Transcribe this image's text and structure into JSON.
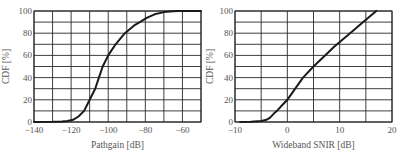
{
  "chart_data": [
    {
      "type": "line",
      "title": "",
      "xlabel": "Pathgain [dB]",
      "ylabel": "CDF [%]",
      "xlim": [
        -140,
        -50
      ],
      "ylim": [
        0,
        100
      ],
      "xticks": [
        -140,
        -120,
        -100,
        -80,
        -60
      ],
      "yticks": [
        0,
        20,
        40,
        60,
        80,
        100
      ],
      "grid": true,
      "grid_x_step": 10,
      "grid_y_step": 10,
      "legend": null,
      "series": [
        {
          "name": "Pathgain CDF",
          "x": [
            -140,
            -130,
            -125,
            -122,
            -119,
            -116,
            -113,
            -110,
            -107,
            -105,
            -103,
            -100,
            -96,
            -91,
            -86,
            -83,
            -79,
            -75,
            -70,
            -65,
            -62,
            -55,
            -50
          ],
          "y": [
            0,
            0.2,
            0.5,
            1,
            2,
            5,
            10,
            20,
            30,
            40,
            50,
            60,
            70,
            80,
            87,
            90,
            94,
            97,
            99,
            99.7,
            100,
            100,
            100
          ]
        }
      ]
    },
    {
      "type": "line",
      "title": "",
      "xlabel": "Wideband SNIR [dB]",
      "ylabel": "CDF [%]",
      "xlim": [
        -10,
        20
      ],
      "ylim": [
        0,
        100
      ],
      "xticks": [
        -10,
        0,
        10,
        20
      ],
      "yticks": [
        0,
        20,
        40,
        60,
        80,
        100
      ],
      "grid": true,
      "grid_x_step": 5,
      "grid_y_step": 10,
      "legend": null,
      "series": [
        {
          "name": "Wideband SNIR CDF",
          "x": [
            -9,
            -7,
            -5,
            -4,
            -3.3,
            -2.5,
            -2,
            -1,
            0,
            1.5,
            3,
            5,
            7,
            9,
            12,
            14.5,
            17
          ],
          "y": [
            0,
            0.3,
            1,
            2,
            4,
            8,
            10,
            15,
            20,
            30,
            40,
            50,
            59,
            68,
            80,
            90,
            100
          ]
        }
      ]
    }
  ]
}
